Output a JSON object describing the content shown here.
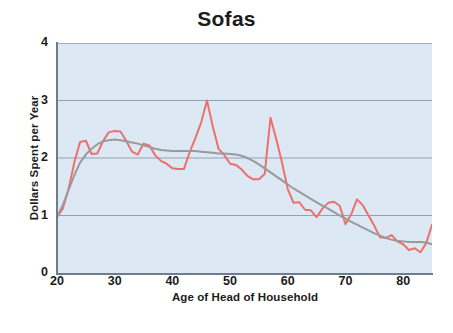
{
  "chart_data": {
    "type": "line",
    "title": "Sofas",
    "xlabel": "Age of Head of Household",
    "ylabel": "Dollars Spent per Year",
    "xlim": [
      20,
      85
    ],
    "ylim": [
      0,
      4
    ],
    "xticks": [
      20,
      30,
      40,
      50,
      60,
      70,
      80
    ],
    "yticks": [
      0,
      1,
      2,
      3,
      4
    ],
    "xtick_labels": [
      "20",
      "30",
      "40",
      "50",
      "60",
      "70",
      "80"
    ],
    "ytick_labels": [
      "0",
      "1",
      "2",
      "3",
      "4"
    ],
    "grid": "horizontal",
    "legend": "none",
    "plot_background": "#dce9f5",
    "series": [
      {
        "name": "raw",
        "color": "#ef6f6c",
        "style": "solid",
        "width": 2.0,
        "x": [
          20,
          21,
          22,
          23,
          24,
          25,
          26,
          27,
          28,
          29,
          30,
          31,
          32,
          33,
          34,
          35,
          36,
          37,
          38,
          39,
          40,
          41,
          42,
          43,
          44,
          45,
          46,
          47,
          48,
          49,
          50,
          51,
          52,
          53,
          54,
          55,
          56,
          57,
          58,
          59,
          60,
          61,
          62,
          63,
          64,
          65,
          66,
          67,
          68,
          69,
          70,
          71,
          72,
          73,
          74,
          75,
          76,
          77,
          78,
          79,
          80,
          81,
          82,
          83,
          84,
          85
        ],
        "y": [
          0.97,
          1.12,
          1.46,
          1.92,
          2.28,
          2.3,
          2.07,
          2.08,
          2.3,
          2.45,
          2.47,
          2.46,
          2.3,
          2.11,
          2.06,
          2.25,
          2.22,
          2.05,
          1.95,
          1.9,
          1.82,
          1.81,
          1.81,
          2.1,
          2.35,
          2.62,
          3.0,
          2.55,
          2.16,
          2.05,
          1.9,
          1.88,
          1.8,
          1.69,
          1.63,
          1.63,
          1.72,
          2.7,
          2.33,
          1.92,
          1.46,
          1.22,
          1.23,
          1.1,
          1.09,
          0.97,
          1.12,
          1.22,
          1.24,
          1.17,
          0.85,
          1.02,
          1.28,
          1.18,
          1.0,
          0.82,
          0.62,
          0.61,
          0.66,
          0.55,
          0.5,
          0.4,
          0.43,
          0.36,
          0.52,
          0.84
        ]
      },
      {
        "name": "smoothed",
        "color": "#9a9a9a",
        "style": "solid",
        "width": 2.0,
        "x": [
          20,
          21,
          22,
          23,
          24,
          25,
          26,
          27,
          28,
          29,
          30,
          31,
          32,
          33,
          34,
          35,
          36,
          37,
          38,
          39,
          40,
          41,
          42,
          43,
          44,
          45,
          46,
          47,
          48,
          49,
          50,
          51,
          52,
          53,
          54,
          55,
          56,
          57,
          58,
          59,
          60,
          61,
          62,
          63,
          64,
          65,
          66,
          67,
          68,
          69,
          70,
          71,
          72,
          73,
          74,
          75,
          76,
          77,
          78,
          79,
          80,
          81,
          82,
          83,
          84,
          85
        ],
        "y": [
          0.97,
          1.18,
          1.44,
          1.7,
          1.92,
          2.06,
          2.16,
          2.24,
          2.29,
          2.31,
          2.32,
          2.31,
          2.29,
          2.27,
          2.25,
          2.22,
          2.19,
          2.16,
          2.14,
          2.13,
          2.12,
          2.12,
          2.12,
          2.12,
          2.12,
          2.11,
          2.1,
          2.09,
          2.08,
          2.08,
          2.07,
          2.06,
          2.04,
          2.0,
          1.95,
          1.89,
          1.82,
          1.75,
          1.68,
          1.61,
          1.54,
          1.47,
          1.41,
          1.35,
          1.29,
          1.23,
          1.17,
          1.12,
          1.06,
          1.0,
          0.95,
          0.89,
          0.84,
          0.79,
          0.74,
          0.69,
          0.65,
          0.61,
          0.58,
          0.56,
          0.55,
          0.54,
          0.54,
          0.54,
          0.53,
          0.5
        ]
      }
    ]
  },
  "figure": {
    "caption": ""
  }
}
